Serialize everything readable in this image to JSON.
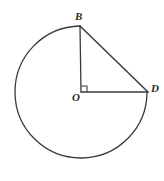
{
  "figure": {
    "background_color": "#ffffff",
    "stroke_color": "#3a3a3a",
    "label_color": "#2b2b2b",
    "labels": {
      "center": "O",
      "top": "B",
      "right": "D"
    },
    "geometry": {
      "center": {
        "x": 81,
        "y": 92
      },
      "radius": 66,
      "point_B": {
        "x": 80,
        "y": 26
      },
      "point_D": {
        "x": 148,
        "y": 92
      },
      "major_arc_start_deg": 270,
      "major_arc_sweep_deg": 270,
      "right_angle_marker": {
        "x": 81,
        "y": 86,
        "size": 6
      },
      "angle_BOD_degrees": 90
    },
    "segments": [
      {
        "name": "radius-OB",
        "from": "O",
        "to": "B"
      },
      {
        "name": "radius-OD",
        "from": "O",
        "to": "D"
      },
      {
        "name": "chord-BD",
        "from": "B",
        "to": "D"
      },
      {
        "name": "major-arc-BD",
        "from": "B",
        "to": "D"
      }
    ]
  }
}
